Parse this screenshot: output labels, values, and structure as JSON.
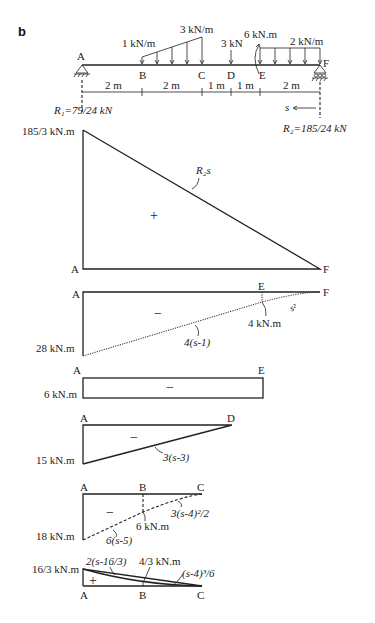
{
  "figure": {
    "panel_label": "b",
    "beam": {
      "points": [
        "A",
        "B",
        "C",
        "D",
        "E",
        "F"
      ],
      "loads": {
        "distributed_start": "1 kN/m",
        "distributed_peak": "3 kN/m",
        "point_load": "3 kN",
        "moment": "6 kN.m",
        "uniform": "2 kN/m"
      },
      "spans": [
        "2 m",
        "2 m",
        "1 m",
        "1 m",
        "2 m"
      ],
      "reaction_left": "R₁=79/24 kN",
      "reaction_right": "R₂=185/24 kN",
      "s_label": "s"
    },
    "diagrams": [
      {
        "name": "R2-moment",
        "start": "A",
        "end": "F",
        "value_label": "185/3 kN.m",
        "sign": "+",
        "curve_label": "R₂s"
      },
      {
        "name": "uniform-load-moment",
        "start": "A",
        "end": "F",
        "mid": "E",
        "value_label": "28 kN.m",
        "sign": "−",
        "curve_label_linear": "4(s-1)",
        "curve_label_quad": "s²",
        "point_label": "4 kN.m"
      },
      {
        "name": "couple-moment",
        "start": "A",
        "end": "E",
        "value_label": "6 kN.m",
        "sign": "−"
      },
      {
        "name": "point-load-moment",
        "start": "A",
        "end": "D",
        "value_label": "15 kN.m",
        "sign": "−",
        "curve_label": "3(s-3)"
      },
      {
        "name": "uniform-1kN-moment",
        "start": "A",
        "mid": "B",
        "end": "C",
        "value_label": "18 kN.m",
        "sign": "−",
        "curve_label_linear": "6(s-5)",
        "curve_label_quad": "3(s-4)²/2",
        "point_label": "6 kN.m"
      },
      {
        "name": "triangular-load-moment",
        "start": "A",
        "mid": "B",
        "end": "C",
        "value_label": "16/3 kN.m",
        "sign": "+",
        "curve_label_linear": "2(s-16/3)",
        "curve_label_cubic": "(s-4)³/6",
        "point_label": "4/3 kN.m"
      }
    ]
  }
}
